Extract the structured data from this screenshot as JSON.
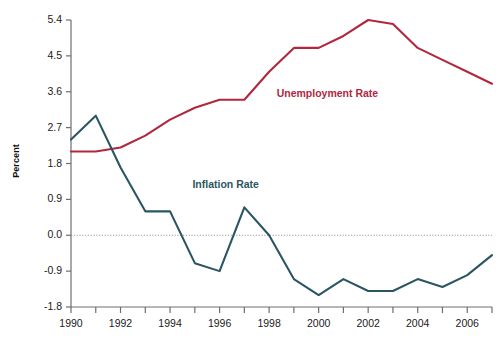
{
  "chart_data": {
    "type": "line",
    "title": "",
    "xlabel": "",
    "ylabel": "Percent",
    "grid": false,
    "zero_line": true,
    "legend_position": "inline-labels",
    "xlim": [
      1990,
      2007
    ],
    "ylim": [
      -1.8,
      5.4
    ],
    "x": [
      1990,
      1991,
      1992,
      1993,
      1994,
      1995,
      1996,
      1997,
      1998,
      1999,
      2000,
      2001,
      2002,
      2003,
      2004,
      2005,
      2006,
      2007
    ],
    "xticks": [
      1990,
      1991,
      1992,
      1993,
      1994,
      1995,
      1996,
      1997,
      1998,
      1999,
      2000,
      2001,
      2002,
      2003,
      2004,
      2005,
      2006,
      2007
    ],
    "xtick_labels": [
      "1990",
      "",
      "1992",
      "",
      "1994",
      "",
      "1996",
      "",
      "1998",
      "",
      "2000",
      "",
      "2002",
      "",
      "2004",
      "",
      "2006",
      ""
    ],
    "xtick_labels_shown": [
      "1990",
      "1992",
      "1994",
      "1996",
      "1998",
      "2000",
      "2002",
      "2004",
      "2006"
    ],
    "yticks": [
      -1.8,
      -0.9,
      0.0,
      0.9,
      1.8,
      2.7,
      3.6,
      4.5,
      5.4
    ],
    "ytick_labels": [
      "-1.8",
      "-0.9",
      "0.0",
      "0.9",
      "1.8",
      "2.7",
      "3.6",
      "4.5",
      "5.4"
    ],
    "series": [
      {
        "name": "Unemployment Rate",
        "color": "#b0283f",
        "label_x": 2000,
        "label_y": 3.55,
        "values": [
          2.1,
          2.1,
          2.2,
          2.5,
          2.9,
          3.2,
          3.4,
          3.4,
          4.1,
          4.7,
          4.7,
          5.0,
          5.4,
          5.3,
          4.7,
          4.4,
          4.1,
          3.8
        ]
      },
      {
        "name": "Inflation Rate",
        "color": "#2b5563",
        "label_x": 1996.6,
        "label_y": 1.25,
        "values": [
          2.4,
          3.0,
          1.7,
          0.6,
          0.6,
          -0.7,
          -0.9,
          0.7,
          0.0,
          -1.1,
          -1.5,
          -1.1,
          -1.4,
          -1.4,
          -1.1,
          -1.3,
          -1.0,
          -0.5
        ]
      }
    ]
  },
  "labels": {
    "y_axis_title": "Percent",
    "series_unemployment": "Unemployment Rate",
    "series_inflation": "Inflation Rate"
  },
  "colors": {
    "unemployment": "#b0283f",
    "inflation": "#2b5563",
    "axis": "#6e6e6e",
    "zero_line": "#9a9a9a",
    "text": "#1a1a1a"
  }
}
